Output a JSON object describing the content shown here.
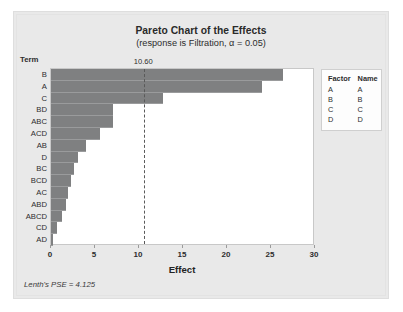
{
  "chart_data": {
    "type": "bar",
    "orientation": "horizontal",
    "title": "Pareto Chart of the Effects",
    "subtitle": "(response is Filtration, α = 0.05)",
    "xlabel": "Effect",
    "ylabel": "Term",
    "categories": [
      "B",
      "A",
      "C",
      "BD",
      "ABC",
      "ACD",
      "AB",
      "D",
      "BC",
      "BCD",
      "AC",
      "ABD",
      "ABCD",
      "CD",
      "AD"
    ],
    "values": [
      26.4,
      24.0,
      12.7,
      7.0,
      7.0,
      5.6,
      4.0,
      3.1,
      2.6,
      2.3,
      1.9,
      1.7,
      1.2,
      0.7,
      0.2
    ],
    "xlim": [
      0,
      30
    ],
    "xticks": [
      "0",
      "5",
      "10",
      "15",
      "20",
      "25",
      "30"
    ],
    "xtick_values": [
      0,
      5,
      10,
      15,
      20,
      25,
      30
    ],
    "grid": false,
    "bar_color": "#7f8081",
    "reference_line": {
      "value": 10.6,
      "label": "10.60",
      "style": "dashed",
      "color": "#5a5a5a"
    },
    "legend_position": "right",
    "annotations": [
      "Lenth's PSE = 4.125"
    ]
  },
  "header": {
    "title": "Pareto Chart of the Effects",
    "subtitle": "(response is Filtration, α = 0.05)"
  },
  "axes": {
    "term_header": "Term",
    "x_title": "Effect",
    "x_tick_labels": [
      "0",
      "5",
      "10",
      "15",
      "20",
      "25",
      "30"
    ],
    "term_labels": [
      "B",
      "A",
      "C",
      "BD",
      "ABC",
      "ACD",
      "AB",
      "D",
      "BC",
      "BCD",
      "AC",
      "ABD",
      "ABCD",
      "CD",
      "AD"
    ]
  },
  "reference": {
    "label": "10.60"
  },
  "legend": {
    "headers": [
      "Factor",
      "Name"
    ],
    "rows": [
      {
        "factor": "A",
        "name": "A"
      },
      {
        "factor": "B",
        "name": "B"
      },
      {
        "factor": "C",
        "name": "C"
      },
      {
        "factor": "D",
        "name": "D"
      }
    ]
  },
  "footnote": {
    "text": "Lenth's PSE = 4.125"
  },
  "colors": {
    "bar": "#7f8081",
    "card_background": "#e9e9e9",
    "plot_background": "#ffffff",
    "text": "#2d2d2d",
    "reference_line": "#5a5a5a"
  }
}
